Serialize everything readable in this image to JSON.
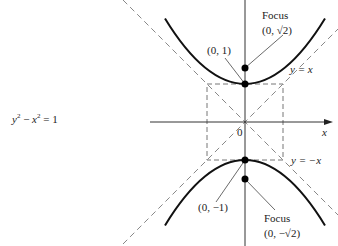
{
  "equation": {
    "y": "y",
    "x": "x",
    "exp": "2",
    "minus": " − ",
    "rhs": " = 1"
  },
  "labels": {
    "focus_top_title": "Focus",
    "focus_top_coord": "(0, √2)",
    "vertex_top": "(0, 1)",
    "asymptote_pos": "y = x",
    "asymptote_neg": "y = −x",
    "x_axis": "x",
    "origin": "0",
    "vertex_bottom": "(0, −1)",
    "focus_bottom_title": "Focus",
    "focus_bottom_coord": "(0, −√2)"
  },
  "colors": {
    "curve": "#111111",
    "axis": "#333333",
    "dashed": "#777777",
    "point": "#000000"
  },
  "geometry": {
    "origin": [
      245,
      122
    ],
    "unit_px": 38
  }
}
